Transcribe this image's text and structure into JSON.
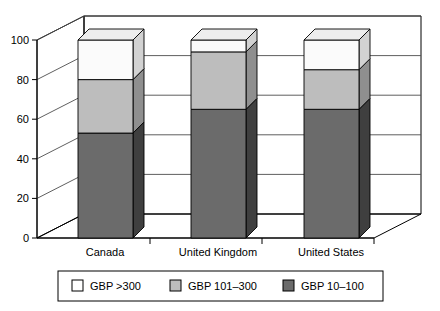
{
  "chart_data": {
    "type": "bar",
    "subtype": "stacked-3d-column",
    "title": "",
    "xlabel": "",
    "ylabel": "",
    "ylim": [
      0,
      100
    ],
    "yticks": [
      0,
      20,
      40,
      60,
      80,
      100
    ],
    "ytick_labels": [
      "0",
      "20",
      "40",
      "60",
      "80",
      "100"
    ],
    "grid": true,
    "grid_axis": "y",
    "legend_position": "bottom",
    "stacked_total": 100,
    "categories": [
      "Canada",
      "United Kingdom",
      "United States"
    ],
    "series": [
      {
        "name": "GBP 10–100",
        "color": "#6b6b6b",
        "side_color": "#3f3f3f",
        "top_color": "#8c8c8c",
        "values": [
          53,
          65,
          65
        ]
      },
      {
        "name": "GBP 101–300",
        "color": "#bdbdbd",
        "side_color": "#8f8f8f",
        "top_color": "#d6d6d6",
        "values": [
          27,
          29,
          20
        ]
      },
      {
        "name": "GBP >300",
        "color": "#fbfbfb",
        "side_color": "#d2d2d2",
        "top_color": "#ededed",
        "values": [
          20,
          6,
          15
        ]
      }
    ],
    "legend_entries": [
      {
        "label": "GBP >300",
        "swatch": "#ffffff"
      },
      {
        "label": "GBP 101–300",
        "swatch": "#bdbdbd"
      },
      {
        "label": "GBP 10–100",
        "swatch": "#6b6b6b"
      }
    ]
  },
  "axis": {
    "ticks": [
      {
        "value": "100"
      },
      {
        "value": "80"
      },
      {
        "value": "60"
      },
      {
        "value": "40"
      },
      {
        "value": "20"
      },
      {
        "value": "0"
      }
    ]
  },
  "categories": [
    {
      "label": "Canada"
    },
    {
      "label": "United Kingdom"
    },
    {
      "label": "United States"
    }
  ],
  "legend": {
    "items": [
      {
        "label": "GBP >300"
      },
      {
        "label": "GBP 101–300"
      },
      {
        "label": "GBP 10–100"
      }
    ]
  }
}
